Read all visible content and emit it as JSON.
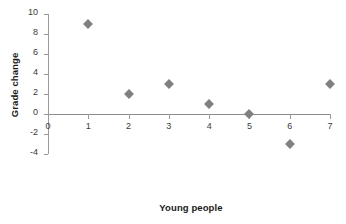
{
  "chart_data": {
    "type": "scatter",
    "title": "",
    "xlabel": "Young people",
    "ylabel": "Grade change",
    "x": [
      1,
      2,
      3,
      4,
      5,
      6,
      7
    ],
    "values": [
      9,
      2,
      3,
      1,
      0,
      -3,
      3
    ],
    "points": [
      {
        "x": 1,
        "y": 9
      },
      {
        "x": 2,
        "y": 2
      },
      {
        "x": 3,
        "y": 3
      },
      {
        "x": 4,
        "y": 1
      },
      {
        "x": 5,
        "y": 0
      },
      {
        "x": 6,
        "y": -3
      },
      {
        "x": 7,
        "y": 3
      }
    ],
    "xlim": [
      0,
      7
    ],
    "ylim": [
      -4,
      10
    ],
    "xticks": [
      "0",
      "1",
      "2",
      "3",
      "4",
      "5",
      "6",
      "7"
    ],
    "yticks": [
      "10",
      "8",
      "6",
      "4",
      "2",
      "0",
      "-2",
      "-4"
    ],
    "grid": false,
    "legend": false,
    "legend_position": "none",
    "marker_shape": "diamond",
    "marker_color": "#808080",
    "axis_color": "#8c8c8c",
    "text_color": "#2b2b2b",
    "background_color": "#ffffff"
  }
}
